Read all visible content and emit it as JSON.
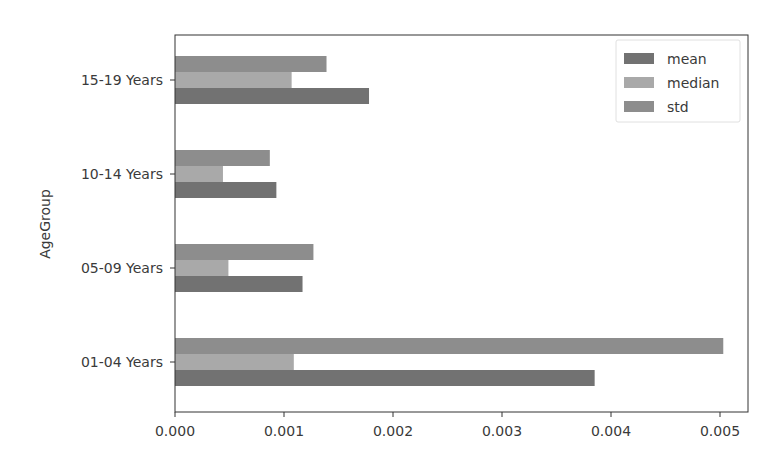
{
  "chart_data": {
    "type": "bar",
    "orientation": "horizontal",
    "title": "",
    "xlabel": "",
    "ylabel": "AgeGroup",
    "categories": [
      "01-04 Years",
      "05-09 Years",
      "10-14 Years",
      "15-19 Years"
    ],
    "series": [
      {
        "name": "mean",
        "color": "#727272",
        "values": [
          0.00385,
          0.00117,
          0.00093,
          0.00178
        ]
      },
      {
        "name": "median",
        "color": "#a9a9a9",
        "values": [
          0.00109,
          0.00049,
          0.00044,
          0.00107
        ]
      },
      {
        "name": "std",
        "color": "#8d8d8d",
        "values": [
          0.00503,
          0.00127,
          0.00087,
          0.00139
        ]
      }
    ],
    "xlim": [
      0,
      0.00529
    ],
    "xticks": [
      0.0,
      0.001,
      0.002,
      0.003,
      0.004,
      0.005
    ],
    "xtick_labels": [
      "0.000",
      "0.001",
      "0.002",
      "0.003",
      "0.004",
      "0.005"
    ],
    "grid": false,
    "legend_position": "upper right"
  }
}
